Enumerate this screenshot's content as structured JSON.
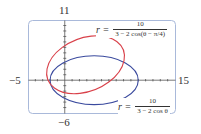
{
  "chart_data": {
    "type": "line",
    "subtype": "polar-curves",
    "title": "",
    "xlabel": "",
    "ylabel": "",
    "xlim": [
      -5,
      15
    ],
    "ylim": [
      -6,
      11
    ],
    "tick_labels": {
      "x_min": "−5",
      "x_max": "15",
      "y_max": "11",
      "y_min": "−6"
    },
    "grid": false,
    "series": [
      {
        "name": "r = 10/(3 − 2 cos(θ − π/4))",
        "color": "#d9414a",
        "shape": "ellipse",
        "center": [
          2.83,
          2.83
        ],
        "semi_major": 6,
        "semi_minor": 4.47,
        "rotation_deg": 45
      },
      {
        "name": "r = 10/(3 − 2 cos θ)",
        "color": "#3a4a9e",
        "shape": "ellipse",
        "center": [
          4,
          0
        ],
        "semi_major": 6,
        "semi_minor": 4.47,
        "rotation_deg": 0
      }
    ]
  },
  "labels": {
    "y_top": "11",
    "y_bottom": "−6",
    "x_left": "−5",
    "x_right": "15"
  },
  "equations": {
    "red": {
      "lhs": "r =",
      "num": "10",
      "den": "3 − 2 cos(θ − π/4)"
    },
    "blue": {
      "lhs": "r =",
      "num": "10",
      "den": "3 − 2 cos θ"
    }
  },
  "colors": {
    "red": "#d9414a",
    "blue": "#3a4a9e",
    "frame": "#a9b9da",
    "axis": "#555555"
  }
}
